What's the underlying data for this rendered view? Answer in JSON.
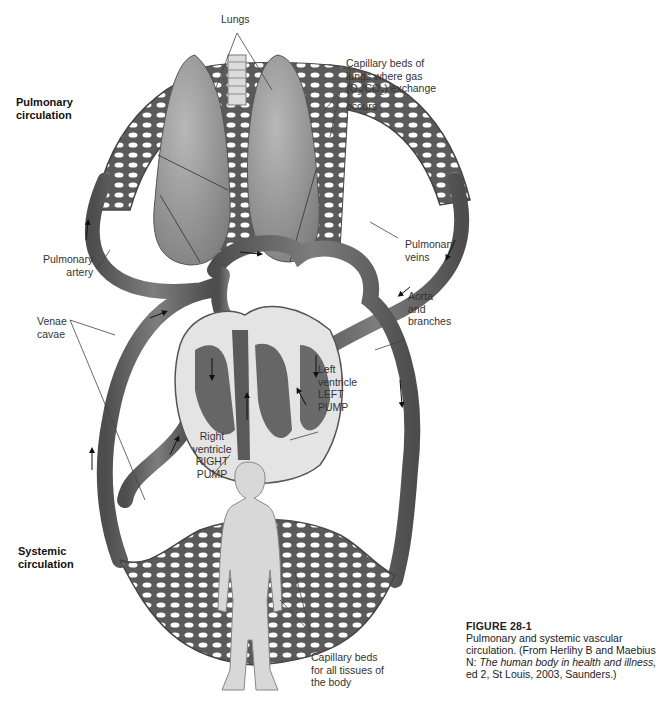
{
  "sections": {
    "pulmonary": [
      "Pulmonary",
      "circulation"
    ],
    "systemic": [
      "Systemic",
      "circulation"
    ]
  },
  "labels": {
    "lungs": [
      "Lungs"
    ],
    "capillary_lungs": [
      "Capillary beds of",
      "lungs where gas",
      "(O2/CO2) exchange",
      "occurs"
    ],
    "pulmonary_artery": [
      "Pulmonary",
      "artery"
    ],
    "pulmonary_veins": [
      "Pulmonary",
      "veins"
    ],
    "aorta": [
      "Aorta",
      "and",
      "branches"
    ],
    "venae_cavae": [
      "Venae",
      "cavae"
    ],
    "left_ventricle": [
      "Left",
      "ventricle",
      "LEFT",
      "PUMP"
    ],
    "right_ventricle": [
      "Right",
      "ventricle",
      "RIGHT",
      "PUMP"
    ],
    "capillary_body": [
      "Capillary beds",
      "for all tissues of",
      "the body"
    ]
  },
  "caption": {
    "figure": "FIGURE 28-1",
    "text": "Pulmonary and systemic vascular circulation. (From Herlihy B and Maebius N: ",
    "book": "The human body in health and illness,",
    "tail": " ed 2, St Louis, 2003, Saunders.)"
  },
  "colors": {
    "vessel": "#5f5f5f",
    "vessel_light": "#8a8a8a",
    "organ": "#9a9a9a",
    "heart_bg": "#e4e4e4",
    "body": "#d8d8d8"
  }
}
